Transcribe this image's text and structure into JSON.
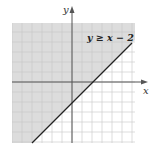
{
  "chart_data": {
    "type": "area",
    "title": "",
    "annotation": "y ≥ x − 2",
    "xlabel": "x",
    "ylabel": "y",
    "inequality": {
      "expression": "y >= x - 2",
      "boundary_line": {
        "slope": 1,
        "intercept": -2,
        "style": "solid"
      },
      "shaded_region": "above-left of line",
      "x_intercept": 2,
      "y_intercept": -2
    },
    "xlim": [
      -6,
      6
    ],
    "ylim": [
      -6,
      6
    ],
    "grid": true,
    "tick_labels": false,
    "boundary_points": [
      [
        -4,
        -6
      ],
      [
        6,
        4
      ]
    ],
    "colors": {
      "shade": "#dcdcdc",
      "grid": "#c8c8c8",
      "axis": "#555555",
      "line": "#222222"
    }
  },
  "labels": {
    "x_axis": "x",
    "y_axis": "y",
    "annotation": "y ≥ x − 2"
  }
}
